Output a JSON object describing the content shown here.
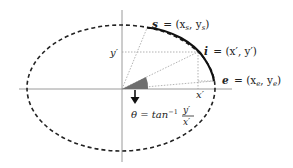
{
  "diagram": {
    "type": "elliptical-arc-parameterization",
    "colors": {
      "ellipse": "#222222",
      "arc": "#111111",
      "axis": "#9a9a9a",
      "guide": "#a0a0a0",
      "angle_fill": "#6e6e6e",
      "arrow": "#111111",
      "text": "#222222"
    },
    "labels": {
      "start_point": "s = (x",
      "start_sub_x": "s",
      "start_mid": ", y",
      "start_sub_y": "s",
      "start_end": ")",
      "start_name": "s",
      "start_coords": "= (x",
      "intermediate_name": "i",
      "intermediate_coords": "= (x′, y′)",
      "end_name": "e",
      "end_coords": "= (x",
      "end_sub_x": "e",
      "end_mid": ", y",
      "end_sub_y": "e",
      "end_close": ")",
      "y_prime": "y′",
      "x_prime": "x′",
      "theta_prefix": "θ = tan",
      "theta_sup": "−1",
      "theta_num": "y′",
      "theta_den": "x′"
    }
  }
}
